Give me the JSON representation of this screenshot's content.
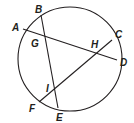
{
  "diagram": {
    "circle": {
      "cx": 70,
      "cy": 59,
      "r": 52
    },
    "chords": [
      {
        "name": "AD",
        "from": "A",
        "to": "D"
      },
      {
        "name": "BE",
        "from": "B",
        "to": "E"
      },
      {
        "name": "CF",
        "from": "C",
        "to": "F"
      }
    ],
    "labels": {
      "A": "A",
      "B": "B",
      "C": "C",
      "D": "D",
      "E": "E",
      "F": "F",
      "G": "G",
      "H": "H",
      "I": "I"
    },
    "stroke_color": "#231f20"
  }
}
